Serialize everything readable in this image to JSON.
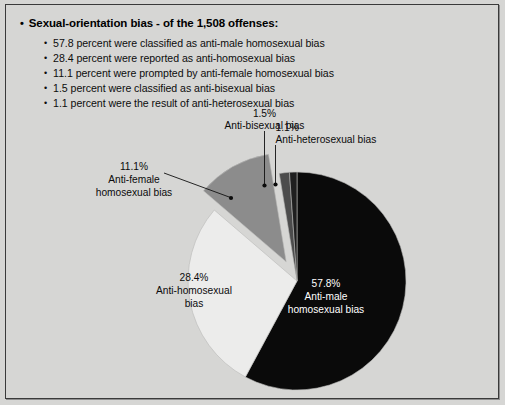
{
  "page": {
    "background_color": "#d6d6d4",
    "border_color": "#3a3a3a"
  },
  "list": {
    "bullet_glyph": "•",
    "header": "Sexual-orientation bias - of the 1,508 offenses:",
    "items": [
      "57.8 percent were classified as anti-male homosexual bias",
      "28.4 percent were reported as anti-homosexual bias",
      "11.1 percent were prompted by anti-female homosexual bias",
      "1.5 percent were classified as anti-bisexual bias",
      "1.1 percent were the result of anti-heterosexual bias"
    ]
  },
  "chart_data": {
    "type": "pie",
    "title": "",
    "xlabel": "",
    "ylabel": "",
    "total_label": "1,508 offenses",
    "start_angle_deg": 0,
    "direction": "clockwise",
    "legend_position": "none",
    "grid": false,
    "categories": [
      "Anti-male homosexual bias",
      "Anti-homosexual bias",
      "Anti-female homosexual bias",
      "Anti-bisexual bias",
      "Anti-heterosexual bias"
    ],
    "values": [
      57.8,
      28.4,
      11.1,
      1.5,
      1.1
    ],
    "value_labels": [
      "57.8%",
      "28.4%",
      "11.1%",
      "1.5%",
      "1.1%"
    ],
    "colors": [
      "#0a0a0a",
      "#ececeb",
      "#8c8c8c",
      "#4c4c4c",
      "#1f1f1f"
    ],
    "exploded": [
      false,
      false,
      true,
      false,
      false
    ],
    "slices": [
      {
        "name": "anti-male-homosexual",
        "percent_label": "57.8%",
        "label_line1": "Anti-male",
        "label_line2": "homosexual bias",
        "color": "#0a0a0a",
        "text_color": "#ffffff",
        "label_placement": "inside"
      },
      {
        "name": "anti-homosexual",
        "percent_label": "28.4%",
        "label_line1": "Anti-homosexual",
        "label_line2": "bias",
        "color": "#ececeb",
        "text_color": "#0b0b0b",
        "label_placement": "inside"
      },
      {
        "name": "anti-female-homosexual",
        "percent_label": "11.1%",
        "label_line1": "Anti-female",
        "label_line2": "homosexual bias",
        "color": "#8c8c8c",
        "text_color": "#0b0b0b",
        "label_placement": "callout"
      },
      {
        "name": "anti-bisexual",
        "percent_label": "1.5%",
        "label_line1": "Anti-bisexual bias",
        "label_line2": "",
        "color": "#4c4c4c",
        "text_color": "#0b0b0b",
        "label_placement": "callout"
      },
      {
        "name": "anti-heterosexual",
        "percent_label": "1.1%",
        "label_line1": "Anti-heterosexual bias",
        "label_line2": "",
        "color": "#1f1f1f",
        "text_color": "#0b0b0b",
        "label_placement": "callout"
      }
    ]
  }
}
